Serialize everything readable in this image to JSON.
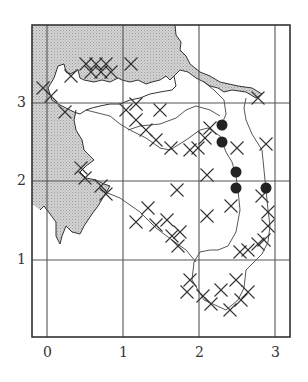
{
  "map": {
    "type": "grid distribution map",
    "x_ticks": [
      {
        "label": "0",
        "px": 47
      },
      {
        "label": "1",
        "px": 123
      },
      {
        "label": "2",
        "px": 199
      },
      {
        "label": "3",
        "px": 275
      }
    ],
    "y_ticks": [
      {
        "label": "3",
        "px": 103
      },
      {
        "label": "2",
        "px": 181
      },
      {
        "label": "1",
        "px": 260
      }
    ],
    "legend": {
      "cross": "record (cross symbol)",
      "dot": "record (filled circle)"
    },
    "colors": {
      "sea_fill": "#c8c8c8",
      "line": "#333333",
      "grid": "#555555",
      "background": "#ffffff"
    },
    "crosses": [
      [
        86,
        64
      ],
      [
        96,
        64
      ],
      [
        106,
        64
      ],
      [
        91,
        72
      ],
      [
        101,
        72
      ],
      [
        111,
        72
      ],
      [
        131,
        64
      ],
      [
        71,
        76
      ],
      [
        43,
        88
      ],
      [
        51,
        96
      ],
      [
        65,
        112
      ],
      [
        126,
        110
      ],
      [
        136,
        120
      ],
      [
        146,
        130
      ],
      [
        156,
        140
      ],
      [
        136,
        104
      ],
      [
        171,
        148
      ],
      [
        160,
        110
      ],
      [
        190,
        150
      ],
      [
        205,
        138
      ],
      [
        198,
        148
      ],
      [
        210,
        128
      ],
      [
        237,
        148
      ],
      [
        266,
        144
      ],
      [
        258,
        98
      ],
      [
        207,
        175
      ],
      [
        81,
        168
      ],
      [
        85,
        178
      ],
      [
        101,
        186
      ],
      [
        106,
        194
      ],
      [
        177,
        190
      ],
      [
        148,
        208
      ],
      [
        136,
        222
      ],
      [
        156,
        225
      ],
      [
        167,
        220
      ],
      [
        172,
        236
      ],
      [
        180,
        232
      ],
      [
        178,
        246
      ],
      [
        207,
        216
      ],
      [
        231,
        206
      ],
      [
        262,
        196
      ],
      [
        268,
        212
      ],
      [
        268,
        226
      ],
      [
        240,
        252
      ],
      [
        248,
        250
      ],
      [
        258,
        244
      ],
      [
        264,
        240
      ],
      [
        190,
        280
      ],
      [
        187,
        292
      ],
      [
        203,
        296
      ],
      [
        211,
        304
      ],
      [
        221,
        290
      ],
      [
        230,
        310
      ],
      [
        241,
        300
      ],
      [
        236,
        280
      ],
      [
        248,
        292
      ]
    ],
    "dots": [
      [
        222,
        125
      ],
      [
        222,
        142
      ],
      [
        236,
        172
      ],
      [
        236,
        188
      ],
      [
        266,
        188
      ]
    ]
  }
}
